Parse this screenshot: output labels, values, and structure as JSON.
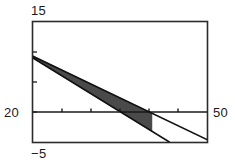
{
  "window_labels": {
    "y_max": "15",
    "y_min": "−5",
    "x_min": "20",
    "x_max": "50"
  },
  "colors": {
    "frame": "#2b2b2b",
    "axis": "#1a1a1a",
    "line": "#111111",
    "shade": "#4a4a4a",
    "background": "#ffffff",
    "text": "#1a1a1a"
  },
  "chart_data": {
    "type": "line",
    "title": "",
    "xlabel": "",
    "ylabel": "",
    "xlim": [
      20,
      50
    ],
    "ylim": [
      -5,
      15
    ],
    "grid": false,
    "legend": null,
    "axis_line_y": 0,
    "x_ticks": [
      25,
      30,
      35,
      40,
      45
    ],
    "y_ticks": [
      0,
      5,
      10
    ],
    "series": [
      {
        "name": "line-1",
        "x": [
          20,
          50
        ],
        "y": [
          9.3,
          -4.6
        ],
        "style": "solid-dotted"
      },
      {
        "name": "line-2",
        "x": [
          20,
          43.5
        ],
        "y": [
          9.0,
          -5.0
        ],
        "style": "solid-dotted"
      }
    ],
    "shaded_region": {
      "name": "between-lines",
      "description": "region bounded between line-1 and line-2",
      "fill": "#4a4a4a",
      "x_start": 20,
      "x_end": 40.5
    }
  }
}
